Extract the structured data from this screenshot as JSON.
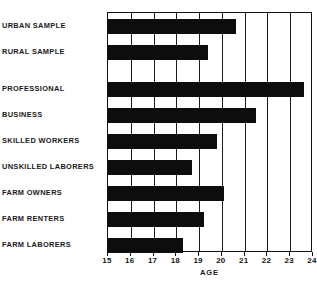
{
  "chart_data": {
    "type": "bar",
    "orientation": "horizontal",
    "title": "",
    "xlabel": "AGE",
    "ylabel": "",
    "xlim": [
      15,
      24
    ],
    "ylim": null,
    "grid": true,
    "legend": null,
    "xticks": [
      "15",
      "16",
      "17",
      "18",
      "19",
      "20",
      "21",
      "22",
      "23",
      "24"
    ],
    "categories": [
      "URBAN SAMPLE",
      "RURAL SAMPLE",
      "PROFESSIONAL",
      "BUSINESS",
      "SKILLED WORKERS",
      "UNSKILLED LABORERS",
      "FARM OWNERS",
      "FARM RENTERS",
      "FARM LABORERS"
    ],
    "values": [
      20.6,
      19.4,
      23.6,
      21.5,
      19.8,
      18.7,
      20.1,
      19.2,
      18.3
    ],
    "bar_color": "#0d0d0d",
    "background_color": "#ffffff",
    "axis_color": "#111111"
  },
  "axis": {
    "x_title": "AGE",
    "tick_labels": [
      "15",
      "16",
      "17",
      "18",
      "19",
      "20",
      "21",
      "22",
      "23",
      "24"
    ]
  },
  "categories": {
    "items": [
      {
        "label": "URBAN SAMPLE",
        "value": 20.6
      },
      {
        "label": "RURAL SAMPLE",
        "value": 19.4
      },
      {
        "label": "PROFESSIONAL",
        "value": 23.6
      },
      {
        "label": "BUSINESS",
        "value": 21.5
      },
      {
        "label": "SKILLED WORKERS",
        "value": 19.8
      },
      {
        "label": "UNSKILLED LABORERS",
        "value": 18.7
      },
      {
        "label": "FARM OWNERS",
        "value": 20.1
      },
      {
        "label": "FARM RENTERS",
        "value": 19.2
      },
      {
        "label": "FARM LABORERS",
        "value": 18.3
      }
    ]
  }
}
